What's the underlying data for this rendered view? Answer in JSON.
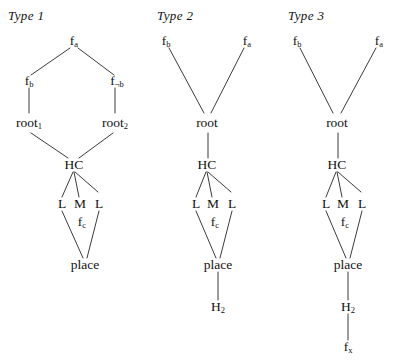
{
  "figure": {
    "title_type1": "Type 1",
    "title_type2": "Type 2",
    "title_type3": "Type 3",
    "background_color": "#ffffff",
    "line_color": "#3b3b3b",
    "text_color": "#111111"
  },
  "type1": {
    "title": "Type 1",
    "nodes": {
      "fa": "f",
      "fa_sub": "a",
      "fb_left": "f",
      "fb_left_sub": "b",
      "fb_right": "f",
      "fb_right_sub": "¬b",
      "root1": "root",
      "root1_sub": "1",
      "root2": "root",
      "root2_sub": "2",
      "hc": "HC",
      "l_left": "L",
      "m": "M",
      "l_right": "L",
      "fc": "f",
      "fc_sub": "c",
      "place": "place"
    }
  },
  "type2": {
    "title": "Type 2",
    "nodes": {
      "fb": "f",
      "fb_sub": "b",
      "fa": "f",
      "fa_sub": "a",
      "root": "root",
      "hc": "HC",
      "l_left": "L",
      "m": "M",
      "l_right": "L",
      "fc": "f",
      "fc_sub": "c",
      "place": "place",
      "h2": "H",
      "h2_sub": "2"
    }
  },
  "type3": {
    "title": "Type 3",
    "nodes": {
      "fb": "f",
      "fb_sub": "b",
      "fa": "f",
      "fa_sub": "a",
      "root": "root",
      "hc": "HC",
      "l_left": "L",
      "m": "M",
      "l_right": "L",
      "fc": "f",
      "fc_sub": "c",
      "place": "place",
      "h2": "H",
      "h2_sub": "2",
      "fx": "f",
      "fx_sub": "x"
    }
  }
}
